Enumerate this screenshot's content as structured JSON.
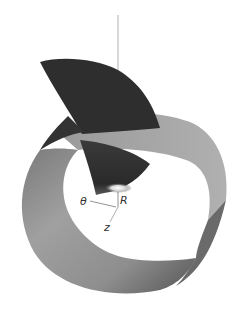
{
  "figure": {
    "type": "3d-surface-diagram",
    "colors": {
      "background": "#ffffff",
      "ring_light": "#a8a8a8",
      "ring_mid": "#8c8c8c",
      "ring_dark": "#5a5a5a",
      "fin": "#2e2e2e",
      "highlight": "#f2f2f2",
      "axis": "#888888",
      "label": "#333333"
    },
    "axes": {
      "theta_label": "θ",
      "r_label": "R",
      "z_label": "z"
    }
  }
}
